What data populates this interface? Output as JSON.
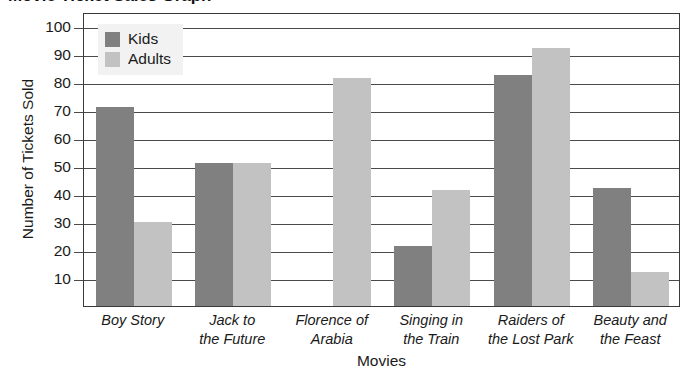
{
  "chart_data": {
    "type": "bar",
    "title": "Movie Ticket Sales Graph",
    "xlabel": "Movies",
    "ylabel": "Number of Tickets Sold",
    "ylim": [
      0,
      105
    ],
    "yticks": [
      10,
      20,
      30,
      40,
      50,
      60,
      70,
      80,
      90,
      100
    ],
    "grid": true,
    "legend_position": "top-left",
    "categories": [
      "Boy Story",
      "Jack to the Future",
      "Florence of Arabia",
      "Singing in the Train",
      "Raiders of the Lost Park",
      "Beauty and the Feast"
    ],
    "category_lines": [
      [
        "Boy Story"
      ],
      [
        "Jack to",
        "the Future"
      ],
      [
        "Florence of",
        "Arabia"
      ],
      [
        "Singing in",
        "the Train"
      ],
      [
        "Raiders of",
        "the Lost Park"
      ],
      [
        "Beauty and",
        "the Feast"
      ]
    ],
    "series": [
      {
        "name": "Kids",
        "color": "#808080",
        "values": [
          71,
          51,
          0,
          21.5,
          82.5,
          42
        ]
      },
      {
        "name": "Adults",
        "color": "#c2c2c2",
        "values": [
          30,
          51,
          81.5,
          41.5,
          92,
          12
        ]
      }
    ]
  },
  "legend": {
    "items": [
      {
        "label": "Kids",
        "swatch": "kids"
      },
      {
        "label": "Adults",
        "swatch": "adults"
      }
    ]
  }
}
